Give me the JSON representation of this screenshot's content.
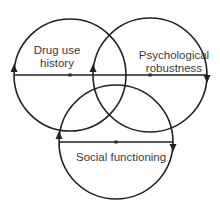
{
  "diagram": {
    "type": "venn",
    "stroke_color": "#222222",
    "text_color": "#3a3a3a",
    "circles": [
      {
        "id": "drug-use-history",
        "label_lines": [
          "Drug use",
          "history"
        ],
        "cx": 70,
        "cy": 75,
        "r": 56
      },
      {
        "id": "psychological-robustness",
        "label_lines": [
          "Psychological",
          "robustness"
        ],
        "cx": 150,
        "cy": 75,
        "r": 57
      },
      {
        "id": "social-functioning",
        "label_lines": [
          "Social functioning"
        ],
        "cx": 116,
        "cy": 142,
        "r": 57
      }
    ]
  }
}
